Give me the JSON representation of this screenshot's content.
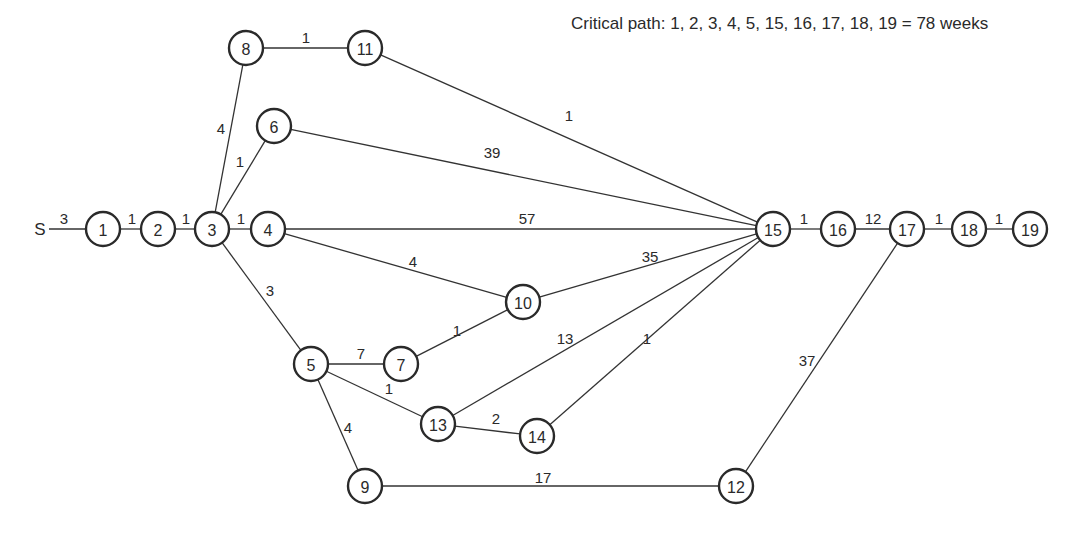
{
  "caption": "Critical path: 1, 2, 3, 4, 5, 15, 16, 17, 18, 19 = 78 weeks",
  "start": {
    "id": "S",
    "label": "S",
    "x": 40,
    "y": 229
  },
  "node_radius": 17,
  "nodes": [
    {
      "id": "1",
      "label": "1",
      "x": 103,
      "y": 229
    },
    {
      "id": "2",
      "label": "2",
      "x": 158,
      "y": 229
    },
    {
      "id": "3",
      "label": "3",
      "x": 212,
      "y": 229
    },
    {
      "id": "4",
      "label": "4",
      "x": 268,
      "y": 229
    },
    {
      "id": "5",
      "label": "5",
      "x": 311,
      "y": 364
    },
    {
      "id": "6",
      "label": "6",
      "x": 274,
      "y": 126
    },
    {
      "id": "7",
      "label": "7",
      "x": 401,
      "y": 364
    },
    {
      "id": "8",
      "label": "8",
      "x": 246,
      "y": 48
    },
    {
      "id": "9",
      "label": "9",
      "x": 365,
      "y": 486
    },
    {
      "id": "10",
      "label": "10",
      "x": 523,
      "y": 302
    },
    {
      "id": "11",
      "label": "11",
      "x": 365,
      "y": 48
    },
    {
      "id": "12",
      "label": "12",
      "x": 736,
      "y": 486
    },
    {
      "id": "13",
      "label": "13",
      "x": 438,
      "y": 424
    },
    {
      "id": "14",
      "label": "14",
      "x": 537,
      "y": 436
    },
    {
      "id": "15",
      "label": "15",
      "x": 773,
      "y": 229
    },
    {
      "id": "16",
      "label": "16",
      "x": 838,
      "y": 229
    },
    {
      "id": "17",
      "label": "17",
      "x": 907,
      "y": 229
    },
    {
      "id": "18",
      "label": "18",
      "x": 969,
      "y": 229
    },
    {
      "id": "19",
      "label": "19",
      "x": 1030,
      "y": 229
    }
  ],
  "edges": [
    {
      "from": "S",
      "to": "1",
      "weight": "3",
      "lx": 64,
      "ly": 224
    },
    {
      "from": "1",
      "to": "2",
      "weight": "1",
      "lx": 132,
      "ly": 224
    },
    {
      "from": "2",
      "to": "3",
      "weight": "1",
      "lx": 186,
      "ly": 224
    },
    {
      "from": "3",
      "to": "4",
      "weight": "1",
      "lx": 241,
      "ly": 224
    },
    {
      "from": "3",
      "to": "8",
      "weight": "4",
      "lx": 221,
      "ly": 134
    },
    {
      "from": "3",
      "to": "6",
      "weight": "1",
      "lx": 240,
      "ly": 167
    },
    {
      "from": "3",
      "to": "5",
      "weight": "3",
      "lx": 270,
      "ly": 296
    },
    {
      "from": "8",
      "to": "11",
      "weight": "1",
      "lx": 306,
      "ly": 43
    },
    {
      "from": "11",
      "to": "15",
      "weight": "1",
      "lx": 569,
      "ly": 121
    },
    {
      "from": "6",
      "to": "15",
      "weight": "39",
      "lx": 492,
      "ly": 158
    },
    {
      "from": "4",
      "to": "15",
      "weight": "57",
      "lx": 527,
      "ly": 224
    },
    {
      "from": "4",
      "to": "10",
      "weight": "4",
      "lx": 413,
      "ly": 267
    },
    {
      "from": "10",
      "to": "15",
      "weight": "35",
      "lx": 650,
      "ly": 262
    },
    {
      "from": "5",
      "to": "7",
      "weight": "7",
      "lx": 361,
      "ly": 359
    },
    {
      "from": "7",
      "to": "10",
      "weight": "1",
      "lx": 457,
      "ly": 336
    },
    {
      "from": "5",
      "to": "13",
      "weight": "1",
      "lx": 389,
      "ly": 394
    },
    {
      "from": "5",
      "to": "9",
      "weight": "4",
      "lx": 348,
      "ly": 433
    },
    {
      "from": "13",
      "to": "15",
      "weight": "13",
      "lx": 565,
      "ly": 344
    },
    {
      "from": "13",
      "to": "14",
      "weight": "2",
      "lx": 496,
      "ly": 424
    },
    {
      "from": "14",
      "to": "15",
      "weight": "1",
      "lx": 647,
      "ly": 344
    },
    {
      "from": "9",
      "to": "12",
      "weight": "17",
      "lx": 543,
      "ly": 483
    },
    {
      "from": "12",
      "to": "17",
      "weight": "37",
      "lx": 807,
      "ly": 366
    },
    {
      "from": "15",
      "to": "16",
      "weight": "1",
      "lx": 804,
      "ly": 224
    },
    {
      "from": "16",
      "to": "17",
      "weight": "12",
      "lx": 873,
      "ly": 224
    },
    {
      "from": "17",
      "to": "18",
      "weight": "1",
      "lx": 939,
      "ly": 224
    },
    {
      "from": "18",
      "to": "19",
      "weight": "1",
      "lx": 999,
      "ly": 224
    }
  ],
  "critical_path": [
    "1",
    "2",
    "3",
    "4",
    "5",
    "15",
    "16",
    "17",
    "18",
    "19"
  ],
  "critical_path_length": "78 weeks",
  "colors": {
    "stroke": "#2a2a2a",
    "background": "#ffffff"
  }
}
